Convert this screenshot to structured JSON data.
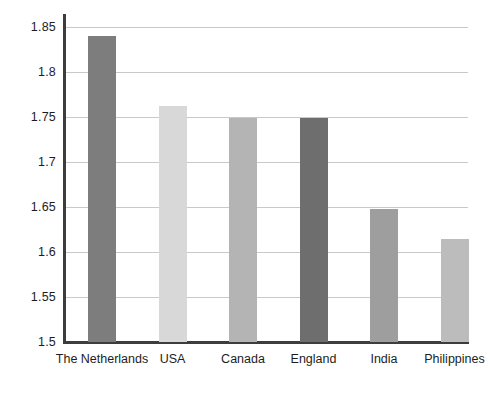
{
  "chart_data": {
    "type": "bar",
    "title": "",
    "subtitle": "",
    "xlabel": "",
    "ylabel": "",
    "categories": [
      "The Netherlands",
      "USA",
      "Canada",
      "England",
      "India",
      "Philippines"
    ],
    "values": [
      1.84,
      1.762,
      1.749,
      1.749,
      1.648,
      1.615
    ],
    "series": [
      {
        "name": "",
        "values": [
          1.84,
          1.762,
          1.749,
          1.749,
          1.648,
          1.615
        ]
      }
    ],
    "bar_colors": [
      "#7d7d7d",
      "#d8d8d8",
      "#b4b4b4",
      "#6e6e6e",
      "#9e9e9e",
      "#bcbcbc"
    ],
    "ylim": [
      1.5,
      1.85
    ],
    "yticks": [
      1.5,
      1.55,
      1.6,
      1.65,
      1.7,
      1.75,
      1.8,
      1.85
    ],
    "ytick_labels": [
      "1.5",
      "1.55",
      "1.6",
      "1.65",
      "1.7",
      "1.75",
      "1.8",
      "1.85"
    ],
    "grid": true,
    "grid_axis": "y",
    "grid_color": "#c9c9c9",
    "axis_color": "#3d3d3d",
    "background_color": "#ffffff",
    "legend": false,
    "legend_position": "none"
  }
}
